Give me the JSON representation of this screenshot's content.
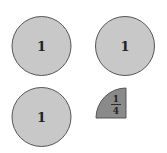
{
  "diagram": {
    "colors": {
      "whole_fill": "#c8c8c8",
      "quarter_fill": "#8a8a8a",
      "stroke": "#555555"
    },
    "shapes": [
      {
        "type": "circle",
        "label": "1"
      },
      {
        "type": "circle",
        "label": "1"
      },
      {
        "type": "circle",
        "label": "1"
      },
      {
        "type": "quarter-circle",
        "numerator": "1",
        "denominator": "4"
      }
    ]
  }
}
